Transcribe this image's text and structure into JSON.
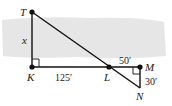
{
  "diagram": {
    "type": "similar-triangles",
    "background_band_color": "#e6e6e6",
    "line_color": "#111111",
    "points": {
      "T": {
        "label": "T",
        "x": 32,
        "y": 12
      },
      "K": {
        "label": "K",
        "x": 32,
        "y": 67
      },
      "L": {
        "label": "L",
        "x": 109,
        "y": 67
      },
      "M": {
        "label": "M",
        "x": 140,
        "y": 67
      },
      "N": {
        "label": "N",
        "x": 140,
        "y": 88
      }
    },
    "measurements": {
      "TK": "x",
      "KL": "125′",
      "LM": "50′",
      "MN": "30′"
    },
    "right_angles": [
      "K",
      "M"
    ]
  }
}
